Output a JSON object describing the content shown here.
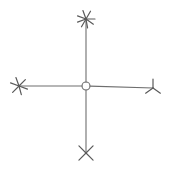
{
  "diagram": {
    "type": "radial-star-graph",
    "background": "#ffffff",
    "line_color": "#6e6e6e",
    "center": {
      "name": "center-node",
      "shape": "open-circle",
      "x": 86,
      "y": 86,
      "r": 4
    },
    "branches": [
      {
        "name": "top",
        "end": {
          "x": 86,
          "y": 19
        },
        "glyph": "star-8-ray",
        "ray_angles": [
          0,
          35,
          80,
          120,
          160,
          200,
          250,
          300
        ],
        "ray_length": 9
      },
      {
        "name": "left",
        "end": {
          "x": 19,
          "y": 86
        },
        "glyph": "star-6-ray",
        "ray_angles": [
          20,
          75,
          135,
          200,
          250,
          315
        ],
        "ray_length": 9
      },
      {
        "name": "right",
        "end": {
          "x": 153,
          "y": 88
        },
        "glyph": "tripod-3-ray",
        "ray_angles": [
          -90,
          35,
          145
        ],
        "ray_length": 9
      },
      {
        "name": "bottom",
        "end": {
          "x": 86,
          "y": 153
        },
        "glyph": "x-star-4-ray",
        "ray_angles": [
          45,
          135,
          225,
          315
        ],
        "ray_length": 10
      }
    ]
  }
}
